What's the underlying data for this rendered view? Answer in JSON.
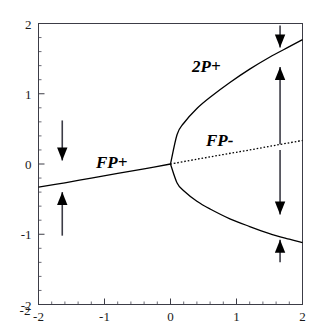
{
  "figure": {
    "title": "",
    "background_color": "#ffffff",
    "axis_color": "#3c3c46",
    "curve_color": "#000000"
  },
  "axes": {
    "x_ticks": [
      "-2",
      "-1",
      "0",
      "1",
      "2"
    ],
    "x_tick_values": [
      -2,
      -1,
      0,
      1,
      2
    ],
    "y_ticks": [
      "2",
      "1",
      "0",
      "-1",
      "-2"
    ],
    "y_tick_values": [
      2,
      1,
      0,
      -1,
      -2
    ],
    "corner_label": "-2",
    "xlim": [
      -2,
      2
    ],
    "ylim": [
      -2,
      2
    ],
    "minor_ticks_per_interval": 5,
    "grid": false
  },
  "labels": {
    "fp_plus": "FP+",
    "fp_minus": "FP-",
    "two_p_plus": "2P+"
  },
  "chart_data": {
    "type": "line",
    "title": "",
    "xlabel": "",
    "ylabel": "",
    "xlim": [
      -2,
      2
    ],
    "ylim": [
      -2,
      2
    ],
    "grid": false,
    "legend": "none",
    "annotations": [
      {
        "text": "FP+",
        "x": -0.95,
        "y": 0.23,
        "style": "bold-italic"
      },
      {
        "text": "FP-",
        "x": 0.72,
        "y": 0.42,
        "style": "bold-italic"
      },
      {
        "text": "2P+",
        "x": 0.52,
        "y": 1.46,
        "style": "bold-italic"
      }
    ],
    "series": [
      {
        "name": "FP+ (stable fixed point)",
        "style": "solid",
        "x": [
          -2.0,
          -1.6,
          -1.2,
          -0.8,
          -0.4,
          0.0
        ],
        "y": [
          -0.33,
          -0.268,
          -0.2,
          -0.135,
          -0.068,
          0.0
        ]
      },
      {
        "name": "FP- (unstable fixed point)",
        "style": "dotted",
        "x": [
          0.0,
          0.4,
          0.8,
          1.2,
          1.6,
          2.0
        ],
        "y": [
          0.0,
          0.068,
          0.135,
          0.2,
          0.268,
          0.335
        ]
      },
      {
        "name": "2P+ upper branch",
        "style": "solid",
        "x": [
          0.0,
          0.1,
          0.2,
          0.4,
          0.6,
          0.9,
          1.2,
          1.5,
          1.8,
          2.0
        ],
        "y": [
          0.0,
          0.42,
          0.58,
          0.79,
          0.95,
          1.16,
          1.35,
          1.52,
          1.67,
          1.77
        ]
      },
      {
        "name": "2P+ lower branch",
        "style": "solid",
        "x": [
          0.0,
          0.1,
          0.2,
          0.4,
          0.6,
          0.9,
          1.2,
          1.5,
          1.8,
          2.0
        ],
        "y": [
          0.0,
          -0.27,
          -0.38,
          -0.53,
          -0.64,
          -0.78,
          -0.89,
          -0.99,
          -1.07,
          -1.12
        ]
      }
    ],
    "flow_arrows": [
      {
        "name": "left-upper-flow",
        "x": -1.64,
        "y_start": 0.62,
        "y_end": 0.05,
        "direction": "down"
      },
      {
        "name": "left-lower-flow",
        "x": -1.64,
        "y_start": -1.02,
        "y_end": -0.4,
        "direction": "up"
      },
      {
        "name": "right-top-flow",
        "x": 1.66,
        "y_start": 1.97,
        "y_end": 1.66,
        "direction": "down"
      },
      {
        "name": "right-upper-flow",
        "x": 1.66,
        "y_start": 0.28,
        "y_end": 1.38,
        "direction": "up"
      },
      {
        "name": "right-mid-flow",
        "x": 1.66,
        "y_start": 0.2,
        "y_end": -0.72,
        "direction": "down"
      },
      {
        "name": "right-bottom-flow",
        "x": 1.66,
        "y_start": -1.4,
        "y_end": -1.08,
        "direction": "up"
      }
    ]
  }
}
